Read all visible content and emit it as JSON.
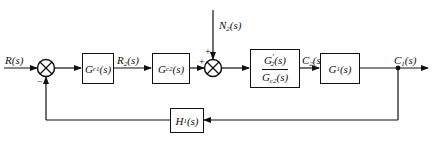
{
  "diagram": {
    "type": "control-system-block-diagram",
    "signals": {
      "input": {
        "main": "R",
        "sub": "",
        "arg": "(s)"
      },
      "intermediate_r2": {
        "main": "R",
        "sub": "2",
        "arg": "(s)"
      },
      "disturbance": {
        "main": "N",
        "sub": "2",
        "arg": "(s)"
      },
      "intermediate_c2": {
        "main": "C",
        "sub": "2",
        "arg": "(s)"
      },
      "output": {
        "main": "C",
        "sub": "1",
        "arg": "(s)"
      }
    },
    "blocks": {
      "gc1": {
        "main": "G",
        "sub": "c1",
        "arg": "(s)"
      },
      "gc2": {
        "main": "G",
        "sub": "c2",
        "arg": "(s)"
      },
      "plant2": {
        "numerator": {
          "main": "G",
          "sub": "2",
          "prime": "′",
          "arg": "(s)"
        },
        "denominator": {
          "main": "G",
          "sub": "c2",
          "arg": "(s)"
        }
      },
      "g1": {
        "main": "G",
        "sub": "1",
        "arg": "(s)"
      },
      "h1": {
        "main": "H",
        "sub": "1",
        "arg": "(s)"
      }
    },
    "summing_junctions": {
      "sum1": {
        "signs": {
          "left": "",
          "bottom": "−"
        }
      },
      "sum2": {
        "signs": {
          "left": "+",
          "top": "+"
        }
      }
    },
    "colors": {
      "line": "#111111",
      "background": "#ffffff"
    }
  }
}
